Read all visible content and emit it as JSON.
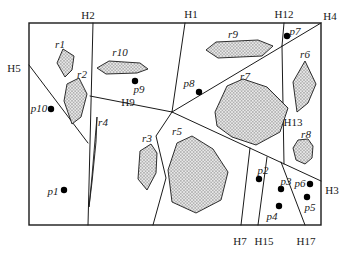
{
  "figure": {
    "width": 352,
    "height": 261,
    "colors": {
      "line": "#1a1a1a",
      "hatch_fill": "#eaeaea",
      "hatch_stroke": "#8f8f8f",
      "background": "#ffffff",
      "dot": "#000000"
    },
    "bounding_rect": {
      "x": 29,
      "y": 23,
      "w": 292,
      "h": 202
    },
    "partition_lines": [
      {
        "name": "h2-line",
        "points": [
          [
            93,
            23
          ],
          [
            88,
            225
          ]
        ]
      },
      {
        "name": "h5-line",
        "points": [
          [
            29,
            65
          ],
          [
            88,
            143
          ]
        ]
      },
      {
        "name": "h9-line",
        "points": [
          [
            90,
            96
          ],
          [
            172,
            112
          ]
        ]
      },
      {
        "name": "h1-line",
        "points": [
          [
            185,
            23
          ],
          [
            172,
            112
          ]
        ]
      },
      {
        "name": "h4-line",
        "points": [
          [
            321,
            23
          ],
          [
            172,
            112
          ]
        ]
      },
      {
        "name": "h12-line",
        "points": [
          [
            284,
            23
          ],
          [
            282,
            46
          ]
        ]
      },
      {
        "name": "h13-line",
        "points": [
          [
            282,
            46
          ],
          [
            284,
            164
          ]
        ]
      },
      {
        "name": "h3-line",
        "points": [
          [
            172,
            112
          ],
          [
            321,
            181
          ]
        ]
      },
      {
        "name": "r5-left-line",
        "points": [
          [
            172,
            112
          ],
          [
            156,
            136
          ],
          [
            166,
            178
          ],
          [
            153,
            225
          ]
        ]
      },
      {
        "name": "h7-line",
        "points": [
          [
            250,
            148
          ],
          [
            241,
            225
          ]
        ]
      },
      {
        "name": "h15-line",
        "points": [
          [
            267,
            157
          ],
          [
            258,
            225
          ]
        ]
      },
      {
        "name": "h17-line",
        "points": [
          [
            281,
            162
          ],
          [
            305,
            225
          ]
        ]
      }
    ],
    "hyperplane_labels": [
      {
        "text": "H2",
        "x": 88,
        "y": 15
      },
      {
        "text": "H1",
        "x": 191,
        "y": 14
      },
      {
        "text": "H12",
        "x": 284,
        "y": 14
      },
      {
        "text": "H4",
        "x": 330,
        "y": 16
      },
      {
        "text": "H5",
        "x": 14,
        "y": 68
      },
      {
        "text": "H3",
        "x": 332,
        "y": 190
      },
      {
        "text": "H9",
        "x": 128,
        "y": 102
      },
      {
        "text": "H13",
        "x": 293,
        "y": 122
      },
      {
        "text": "H7",
        "x": 240,
        "y": 241
      },
      {
        "text": "H15",
        "x": 264,
        "y": 241
      },
      {
        "text": "H17",
        "x": 306,
        "y": 241
      }
    ],
    "regions": [
      {
        "name": "r1",
        "label": {
          "x": 60,
          "y": 44
        },
        "points": [
          [
            63,
            49
          ],
          [
            74,
            56
          ],
          [
            72,
            70
          ],
          [
            65,
            77
          ],
          [
            57,
            63
          ]
        ]
      },
      {
        "name": "r2",
        "label": {
          "x": 82,
          "y": 74
        },
        "points": [
          [
            67,
            84
          ],
          [
            79,
            78
          ],
          [
            87,
            94
          ],
          [
            81,
            117
          ],
          [
            72,
            124
          ],
          [
            64,
            101
          ]
        ]
      },
      {
        "name": "r3",
        "label": {
          "x": 147,
          "y": 138
        },
        "points": [
          [
            140,
            151
          ],
          [
            151,
            144
          ],
          [
            157,
            153
          ],
          [
            156,
            173
          ],
          [
            147,
            190
          ],
          [
            138,
            179
          ]
        ]
      },
      {
        "name": "r4",
        "label": {
          "x": 103,
          "y": 122
        },
        "points": [
          [
            97,
            117
          ],
          [
            96,
            142
          ],
          [
            92,
            182
          ],
          [
            89,
            207
          ],
          [
            92,
            176
          ],
          [
            95,
            140
          ]
        ]
      },
      {
        "name": "r5",
        "label": {
          "x": 177,
          "y": 131
        },
        "points": [
          [
            177,
            143
          ],
          [
            192,
            136
          ],
          [
            213,
            149
          ],
          [
            228,
            172
          ],
          [
            221,
            200
          ],
          [
            196,
            213
          ],
          [
            172,
            202
          ],
          [
            168,
            170
          ]
        ]
      },
      {
        "name": "r6",
        "label": {
          "x": 305,
          "y": 54
        },
        "points": [
          [
            305,
            61
          ],
          [
            316,
            84
          ],
          [
            308,
            103
          ],
          [
            297,
            112
          ],
          [
            293,
            82
          ]
        ]
      },
      {
        "name": "r7",
        "label": {
          "x": 245,
          "y": 76
        },
        "points": [
          [
            215,
            112
          ],
          [
            227,
            86
          ],
          [
            243,
            79
          ],
          [
            267,
            87
          ],
          [
            288,
            108
          ],
          [
            280,
            132
          ],
          [
            256,
            145
          ],
          [
            232,
            137
          ],
          [
            217,
            126
          ]
        ]
      },
      {
        "name": "r8",
        "label": {
          "x": 306,
          "y": 134
        },
        "points": [
          [
            298,
            140
          ],
          [
            308,
            139
          ],
          [
            313,
            146
          ],
          [
            312,
            158
          ],
          [
            305,
            164
          ],
          [
            296,
            160
          ],
          [
            293,
            148
          ]
        ]
      },
      {
        "name": "r9",
        "label": {
          "x": 233,
          "y": 34
        },
        "points": [
          [
            206,
            50
          ],
          [
            216,
            42
          ],
          [
            258,
            40
          ],
          [
            273,
            46
          ],
          [
            262,
            56
          ],
          [
            218,
            58
          ]
        ]
      },
      {
        "name": "r10",
        "label": {
          "x": 120,
          "y": 52
        },
        "points": [
          [
            97,
            68
          ],
          [
            109,
            61
          ],
          [
            140,
            63
          ],
          [
            148,
            69
          ],
          [
            137,
            73
          ],
          [
            106,
            74
          ]
        ]
      }
    ],
    "points": [
      {
        "name": "p1",
        "dot": [
          64,
          190
        ],
        "label": {
          "x": 53,
          "y": 191
        }
      },
      {
        "name": "p2",
        "dot": [
          259,
          179
        ],
        "label": {
          "x": 263,
          "y": 170
        }
      },
      {
        "name": "p3",
        "dot": [
          281,
          189
        ],
        "label": {
          "x": 286,
          "y": 181
        }
      },
      {
        "name": "p4",
        "dot": [
          279,
          206
        ],
        "label": {
          "x": 272,
          "y": 216
        }
      },
      {
        "name": "p5",
        "dot": [
          307,
          197
        ],
        "label": {
          "x": 310,
          "y": 207
        }
      },
      {
        "name": "p6",
        "dot": [
          310,
          184
        ],
        "label": {
          "x": 300,
          "y": 183
        }
      },
      {
        "name": "p7",
        "dot": [
          287,
          36
        ],
        "label": {
          "x": 295,
          "y": 31
        }
      },
      {
        "name": "p8",
        "dot": [
          199,
          92
        ],
        "label": {
          "x": 189,
          "y": 83
        }
      },
      {
        "name": "p9",
        "dot": [
          135,
          81
        ],
        "label": {
          "x": 139,
          "y": 89
        }
      },
      {
        "name": "p10",
        "dot": [
          51,
          109
        ],
        "label": {
          "x": 39,
          "y": 108
        }
      }
    ]
  }
}
